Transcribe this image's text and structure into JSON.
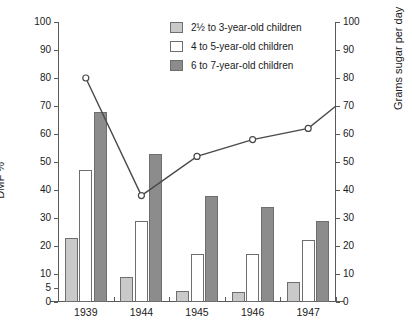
{
  "chart_data": {
    "type": "bar",
    "title": "",
    "subtitle": "",
    "categories": [
      "1939",
      "1944",
      "1945",
      "1946",
      "1947"
    ],
    "series": [
      {
        "name": "2½ to 3-year-old children",
        "values": [
          23,
          9,
          4,
          3.5,
          7
        ],
        "color": "#c9c9c9"
      },
      {
        "name": "4 to 5-year-old children",
        "values": [
          47,
          29,
          17,
          17,
          22
        ],
        "color": "#ffffff"
      },
      {
        "name": "6 to 7-year-old children",
        "values": [
          68,
          53,
          38,
          34,
          29
        ],
        "color": "#8c8c8c"
      }
    ],
    "line_series": {
      "name": "Grams sugar per day",
      "values": [
        80,
        38,
        52,
        58,
        62
      ],
      "extend_to": 70,
      "color": "#4a4a4a",
      "marker": "open-circle"
    },
    "xlabel": "",
    "ylabel": "DMF %",
    "y2label": "Grams sugar per day",
    "ylim": [
      0,
      100
    ],
    "y2lim": [
      0,
      100
    ],
    "yticks": [
      0,
      5,
      10,
      20,
      30,
      40,
      50,
      60,
      70,
      80,
      90,
      100
    ],
    "y2ticks": [
      0,
      10,
      20,
      30,
      40,
      50,
      60,
      70,
      80,
      90,
      100
    ],
    "grid": false,
    "legend_position": "top-right"
  },
  "axes": {
    "left": {
      "title": "DMF %",
      "labels": [
        "100",
        "90",
        "80",
        "70",
        "60",
        "50",
        "40",
        "30",
        "20",
        "10",
        "5",
        "0"
      ],
      "values": [
        100,
        90,
        80,
        70,
        60,
        50,
        40,
        30,
        20,
        10,
        5,
        0
      ]
    },
    "right": {
      "title": "Grams sugar per day",
      "labels": [
        "100",
        "90",
        "80",
        "70",
        "60",
        "50",
        "40",
        "30",
        "20",
        "10",
        "0"
      ],
      "values": [
        100,
        90,
        80,
        70,
        60,
        50,
        40,
        30,
        20,
        10,
        0
      ]
    },
    "x": {
      "labels": [
        "1939",
        "1944",
        "1945",
        "1946",
        "1947"
      ]
    }
  },
  "legend": {
    "items": [
      {
        "label": "2½ to 3-year-old children",
        "swatch": "s0"
      },
      {
        "label": "4 to 5-year-old children",
        "swatch": "s1"
      },
      {
        "label": "6 to 7-year-old children",
        "swatch": "s2"
      }
    ]
  }
}
